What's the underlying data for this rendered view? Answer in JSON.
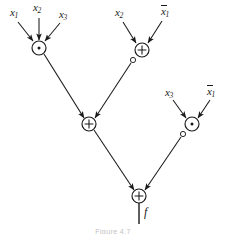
{
  "figure": {
    "type": "logic-circuit-diagram",
    "width": 226,
    "height": 234,
    "background_color": "#ffffff",
    "line_color": "#1a1a1a",
    "caption": "Figure 4.7"
  },
  "inputs": [
    {
      "id": "in-x1-a",
      "base": "x",
      "sub": "1",
      "overbar": false,
      "label": "x1",
      "x": 10,
      "y": 7
    },
    {
      "id": "in-x2-a",
      "base": "x",
      "sub": "2",
      "overbar": false,
      "label": "x2",
      "x": 33,
      "y": 2
    },
    {
      "id": "in-x3-a",
      "base": "x",
      "sub": "3",
      "overbar": false,
      "label": "x3",
      "x": 59,
      "y": 9
    },
    {
      "id": "in-x2-b",
      "base": "x",
      "sub": "2",
      "overbar": false,
      "label": "x2",
      "x": 115,
      "y": 7
    },
    {
      "id": "in-x1bar-b",
      "base": "x",
      "sub": "1",
      "overbar": true,
      "label": "x1-bar",
      "x": 161,
      "y": 6
    },
    {
      "id": "in-x3-c",
      "base": "x",
      "sub": "3",
      "overbar": false,
      "label": "x3",
      "x": 165,
      "y": 87
    },
    {
      "id": "in-x1bar-c",
      "base": "x",
      "sub": "1",
      "overbar": true,
      "label": "x1-bar",
      "x": 207,
      "y": 86
    }
  ],
  "gates": [
    {
      "id": "gate-and-1",
      "symbol": "·",
      "kind": "and",
      "cx": 39,
      "cy": 48,
      "r": 7,
      "bubble": false
    },
    {
      "id": "gate-xor-2",
      "symbol": "+",
      "kind": "xor",
      "cx": 142,
      "cy": 50,
      "r": 7,
      "bubble": true,
      "bubble_cx": 133,
      "bubble_cy": 60,
      "bubble_r": 2.6
    },
    {
      "id": "gate-xor-3",
      "symbol": "+",
      "kind": "xor",
      "cx": 89,
      "cy": 124,
      "r": 7,
      "bubble": false
    },
    {
      "id": "gate-and-4",
      "symbol": "·",
      "kind": "and",
      "cx": 192,
      "cy": 124,
      "r": 7,
      "bubble": true,
      "bubble_cx": 183,
      "bubble_cy": 134,
      "bubble_r": 2.6
    },
    {
      "id": "gate-xor-5",
      "symbol": "+",
      "kind": "xor",
      "cx": 139,
      "cy": 196,
      "r": 7,
      "bubble": false
    }
  ],
  "output": {
    "id": "output-f",
    "label": "f",
    "x": 144,
    "y": 208,
    "line": {
      "x1": 139,
      "y1": 203,
      "x2": 139,
      "y2": 224
    }
  },
  "wires": [
    {
      "id": "wire-x1-to-and1",
      "from": "in-x1-a",
      "to": "gate-and-1",
      "x1": 18,
      "y1": 22,
      "x2": 33,
      "y2": 41
    },
    {
      "id": "wire-x2-to-and1",
      "from": "in-x2-a",
      "to": "gate-and-1",
      "x1": 39,
      "y1": 18,
      "x2": 39,
      "y2": 40
    },
    {
      "id": "wire-x3-to-and1",
      "from": "in-x3-a",
      "to": "gate-and-1",
      "x1": 60,
      "y1": 23,
      "x2": 45,
      "y2": 41
    },
    {
      "id": "wire-x2-to-xor2",
      "from": "in-x2-b",
      "to": "gate-xor-2",
      "x1": 123,
      "y1": 22,
      "x2": 136,
      "y2": 43
    },
    {
      "id": "wire-x1bar-to-xor2",
      "from": "in-x1bar-b",
      "to": "gate-xor-2",
      "x1": 162,
      "y1": 21,
      "x2": 148,
      "y2": 43
    },
    {
      "id": "wire-and1-to-xor3",
      "from": "gate-and-1",
      "to": "gate-xor-3",
      "x1": 44,
      "y1": 54,
      "x2": 84,
      "y2": 118
    },
    {
      "id": "wire-xor2-to-xor3",
      "from": "gate-xor-2",
      "to": "gate-xor-3",
      "x1": 131,
      "y1": 63,
      "x2": 95,
      "y2": 118
    },
    {
      "id": "wire-x3-to-and4",
      "from": "in-x3-c",
      "to": "gate-and-4",
      "x1": 173,
      "y1": 100,
      "x2": 186,
      "y2": 118
    },
    {
      "id": "wire-x1bar-to-and4",
      "from": "in-x1bar-c",
      "to": "gate-and-4",
      "x1": 210,
      "y1": 100,
      "x2": 198,
      "y2": 118
    },
    {
      "id": "wire-xor3-to-xor5",
      "from": "gate-xor-3",
      "to": "gate-xor-5",
      "x1": 94,
      "y1": 130,
      "x2": 134,
      "y2": 190
    },
    {
      "id": "wire-and4-to-xor5",
      "from": "gate-and-4",
      "to": "gate-xor-5",
      "x1": 181,
      "y1": 137,
      "x2": 145,
      "y2": 190
    }
  ]
}
